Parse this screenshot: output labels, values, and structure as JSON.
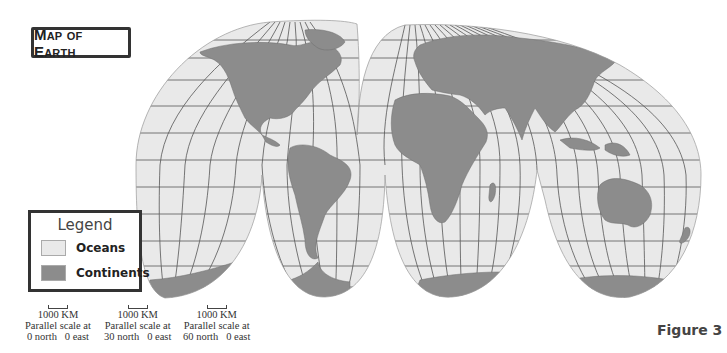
{
  "title": "Map of Earth",
  "figure_label": "Figure 3",
  "colors": {
    "ocean": "#e9e9e9",
    "continent": "#8c8c8c",
    "grid": "#555555",
    "border": "#333333"
  },
  "legend": {
    "title": "Legend",
    "items": [
      {
        "label": "Oceans",
        "color": "#e9e9e9"
      },
      {
        "label": "Continents",
        "color": "#8c8c8c"
      }
    ]
  },
  "scales": [
    {
      "distance": "1000 KM",
      "caption": "Parallel scale at",
      "lat": "0 north",
      "lon": "0 east"
    },
    {
      "distance": "1000 KM",
      "caption": "Parallel scale at",
      "lat": "30 north",
      "lon": "0 east"
    },
    {
      "distance": "1000 KM",
      "caption": "Parallel scale at",
      "lat": "60 north",
      "lon": "0 east"
    }
  ],
  "map": {
    "projection": "interrupted (Goode-style) world map",
    "lobes_north": 2,
    "lobes_south": 4
  }
}
